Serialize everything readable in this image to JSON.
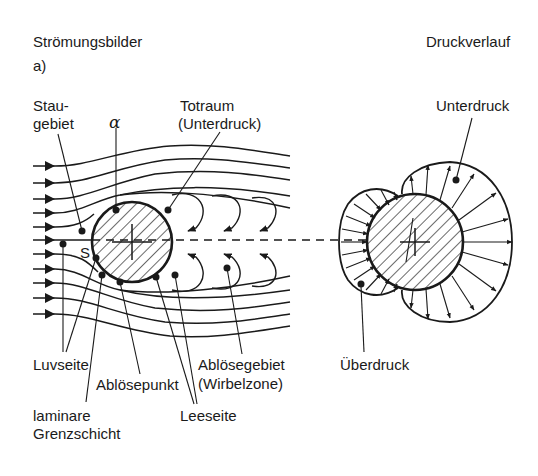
{
  "figure": {
    "left_panel": {
      "title": "Strömungsbilder",
      "subfigure": "a)",
      "labels": {
        "staugebiet_1": "Stau-",
        "staugebiet_2": "gebiet",
        "alpha": "α",
        "totraum_1": "Totraum",
        "totraum_2": "(Unterdruck)",
        "stagnation_point": "S",
        "luvseite": "Luvseite",
        "abloesepunkt": "Ablösepunkt",
        "abloesegebiet_1": "Ablösegebiet",
        "abloesegebiet_2": "(Wirbelzone)",
        "laminare_1": "laminare",
        "laminare_2": "Grenzschicht",
        "leeseite": "Leeseite"
      }
    },
    "right_panel": {
      "title": "Druckverlauf",
      "labels": {
        "unterdruck": "Unterdruck",
        "ueberdruck": "Überdruck"
      }
    },
    "colors": {
      "ink": "#1a1a1a",
      "background": "#ffffff"
    }
  }
}
